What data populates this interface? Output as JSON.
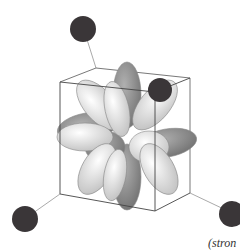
{
  "diagram": {
    "ligand_color": "#3a3638",
    "lobe_light": "#eeeeee",
    "lobe_dark": "#8a8a8a",
    "edge_color": "#444444"
  },
  "caption": "(stron"
}
